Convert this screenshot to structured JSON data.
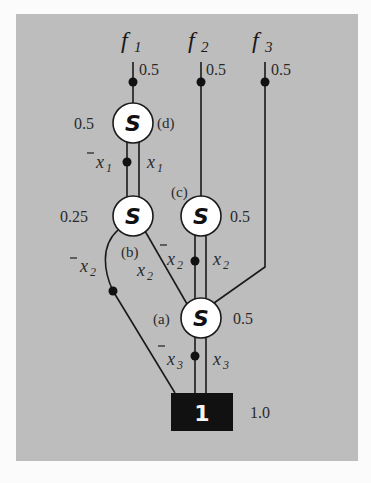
{
  "diagram": {
    "title": "",
    "outputs": [
      {
        "id": "f1",
        "label": "f",
        "sub": "1",
        "value": "0.5"
      },
      {
        "id": "f2",
        "label": "f",
        "sub": "2",
        "value": "0.5"
      },
      {
        "id": "f3",
        "label": "f",
        "sub": "3",
        "value": "0.5"
      }
    ],
    "nodes": {
      "d": {
        "symbol": "S",
        "tag": "(d)",
        "prob": "0.5"
      },
      "b": {
        "symbol": "S",
        "tag": "(b)",
        "prob": "0.25"
      },
      "c": {
        "symbol": "S",
        "tag": "(c)",
        "prob": "0.5"
      },
      "a": {
        "symbol": "S",
        "tag": "(a)",
        "prob": "0.5"
      },
      "terminal": {
        "symbol": "1",
        "prob": "1.0"
      }
    },
    "edges": [
      {
        "from": "d",
        "to": "b",
        "neg": {
          "var": "x",
          "sub": "1"
        },
        "pos": {
          "var": "x",
          "sub": "1"
        }
      },
      {
        "from": "b",
        "to": "terminal",
        "neg": {
          "var": "x",
          "sub": "2"
        }
      },
      {
        "from": "b",
        "to": "a",
        "pos": {
          "var": "x",
          "sub": "2"
        }
      },
      {
        "from": "c",
        "to": "a",
        "neg": {
          "var": "x",
          "sub": "2"
        },
        "pos": {
          "var": "x",
          "sub": "2"
        }
      },
      {
        "from": "a",
        "to": "terminal",
        "neg": {
          "var": "x",
          "sub": "3"
        },
        "pos": {
          "var": "x",
          "sub": "3"
        }
      }
    ],
    "colors": {
      "panel": "#bdbdbd",
      "background": "#fbfbfb",
      "node_fill": "#ffffff",
      "terminal_fill": "#111111"
    }
  }
}
